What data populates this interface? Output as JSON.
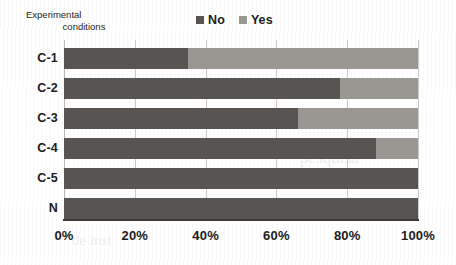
{
  "axis_title": {
    "line1": "Experimental",
    "line2": "conditions"
  },
  "legend": {
    "entries": [
      {
        "label": "No",
        "color": "#585451"
      },
      {
        "label": "Yes",
        "color": "#9a9793"
      }
    ]
  },
  "colors": {
    "no": "#585451",
    "yes": "#9a9793",
    "gridline": "#cfcac6",
    "axis": "#3a3634",
    "background": "#ffffff",
    "text": "#201c1b"
  },
  "chart_data": {
    "type": "bar",
    "orientation": "horizontal",
    "stacked": "100%",
    "title": "",
    "subtitle": "",
    "xlabel": "",
    "ylabel": "Experimental conditions",
    "categories": [
      "C-1",
      "C-2",
      "C-3",
      "C-4",
      "C-5",
      "N"
    ],
    "series": [
      {
        "name": "No",
        "color": "#585451",
        "values": [
          35,
          78,
          66,
          88,
          100,
          100
        ]
      },
      {
        "name": "Yes",
        "color": "#9a9793",
        "values": [
          65,
          22,
          34,
          12,
          0,
          0
        ]
      }
    ],
    "xlim": [
      0,
      100
    ],
    "xticks": [
      0,
      20,
      40,
      60,
      80,
      100
    ],
    "xtick_labels": [
      "0%",
      "20%",
      "40%",
      "60%",
      "80%",
      "100%"
    ],
    "grid": "vertical",
    "legend_position": "top-center",
    "value_unit": "%"
  },
  "artifacts": {
    "bleed_a": "scanned page bleed-through",
    "bleed_b": "scanned page bleed-through",
    "bleed_c": "scanned page bleed-through"
  }
}
